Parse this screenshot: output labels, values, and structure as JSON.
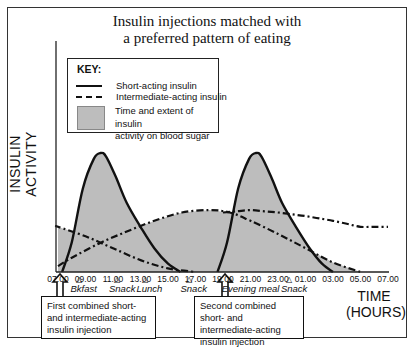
{
  "chart_data": {
    "type": "area",
    "title_lines": [
      "Insulin injections matched with",
      "a preferred pattern of eating"
    ],
    "ylabel": "INSULIN ACTIVITY",
    "xlabel_lines": [
      "TIME",
      "(HOURS)"
    ],
    "x_ticks": [
      "07.00",
      "09.00",
      "11.00",
      "13.00",
      "15.00",
      "17.00",
      "19.00",
      "21.00",
      "23.00",
      "01.00",
      "03.00",
      "05.00",
      "07.00"
    ],
    "x_range_hours": [
      0,
      24
    ],
    "y_range": [
      0,
      1
    ],
    "legend": {
      "title": "KEY:",
      "placement": "top-left",
      "entries": [
        {
          "style": "solid",
          "label": "Short-acting insulin"
        },
        {
          "style": "dash-dot",
          "label": "Intermediate-acting insulin"
        },
        {
          "style": "fill",
          "label_lines": [
            "Time and extent of insulin",
            "activity on blood sugar"
          ]
        }
      ]
    },
    "series": [
      {
        "name": "Short-acting insulin (morning)",
        "style": "solid",
        "x_hours": [
          0.3,
          1,
          1.8,
          2.6,
          3.1,
          3.5,
          4.2,
          5,
          6,
          7,
          8,
          8.9
        ],
        "values": [
          0,
          0.25,
          0.7,
          0.95,
          1.0,
          0.97,
          0.8,
          0.58,
          0.38,
          0.2,
          0.07,
          0
        ]
      },
      {
        "name": "Short-acting insulin (evening)",
        "style": "solid",
        "x_hours": [
          11.6,
          12.3,
          13.1,
          13.9,
          14.4,
          14.8,
          15.5,
          16.3,
          17.3,
          18.3,
          19.2,
          20.0
        ],
        "values": [
          0,
          0.25,
          0.7,
          0.95,
          1.0,
          0.97,
          0.8,
          0.58,
          0.38,
          0.2,
          0.07,
          0
        ]
      },
      {
        "name": "Intermediate-acting insulin (morning)",
        "style": "dash-dot",
        "x_hours": [
          0,
          1,
          3,
          5,
          7,
          9,
          11,
          12.5,
          14,
          16,
          18,
          20,
          22
        ],
        "values": [
          0.05,
          0.12,
          0.24,
          0.34,
          0.43,
          0.5,
          0.52,
          0.5,
          0.43,
          0.32,
          0.2,
          0.08,
          0
        ]
      },
      {
        "name": "Intermediate-acting insulin (evening)",
        "style": "dash-dot",
        "x_hours": [
          -12,
          -10,
          -8,
          -6,
          -4,
          -2,
          0,
          2,
          4,
          6,
          8,
          10
        ],
        "values": [
          0.5,
          0.52,
          0.5,
          0.47,
          0.43,
          0.38,
          0.38,
          0.3,
          0.2,
          0.1,
          0.03,
          0
        ]
      }
    ],
    "annotations": {
      "meals": [
        {
          "label": "Bkfast",
          "hour": 1.2
        },
        {
          "label": "Snack",
          "hour": 4.0
        },
        {
          "label": "Lunch",
          "hour": 6.0
        },
        {
          "label": "Snack",
          "hour": 9.2
        },
        {
          "label": "Evening meal",
          "hour": 12.2
        },
        {
          "label": "Snack",
          "hour": 16.5
        }
      ],
      "injections": [
        {
          "hour": 0,
          "label": "First combined short- and intermediate-acting insulin injection"
        },
        {
          "hour": 12,
          "label": "Second combined short- and intermediate-acting insulin injection"
        }
      ]
    }
  },
  "callouts": {
    "first": "First combined short- and intermediate-acting insulin injection",
    "second": "Second combined short- and intermediate-acting insulin injection"
  },
  "colors": {
    "fill": "#bdbdbd",
    "line": "#111111"
  }
}
